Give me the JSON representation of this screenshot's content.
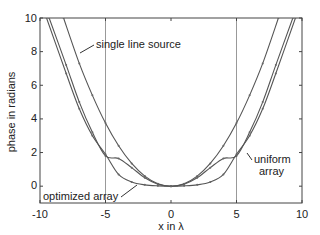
{
  "chart_data": {
    "type": "line",
    "title": "",
    "xlabel": "x in λ",
    "ylabel": "phase in radians",
    "xlim": [
      -10,
      10
    ],
    "ylim": [
      -1,
      10
    ],
    "xticks": [
      -10,
      -5,
      0,
      5,
      10
    ],
    "yticks": [
      0,
      2,
      4,
      6,
      8,
      10
    ],
    "xtick_labels": [
      "-10",
      "-5",
      "0",
      "5",
      "10"
    ],
    "ytick_labels": [
      "0",
      "2",
      "4",
      "6",
      "8",
      "10"
    ],
    "grid": false,
    "vertical_reference_lines": [
      -5,
      5
    ],
    "series": [
      {
        "name": "single line source",
        "x": [
          -8.2,
          -7,
          -6,
          -5,
          -4,
          -3,
          -2,
          -1,
          0,
          1,
          2,
          3,
          4,
          5,
          6,
          7,
          8.2
        ],
        "values": [
          10.0,
          7.3,
          5.4,
          3.75,
          2.4,
          1.35,
          0.6,
          0.15,
          0,
          0.15,
          0.6,
          1.35,
          2.4,
          3.75,
          5.4,
          7.3,
          10.0
        ]
      },
      {
        "name": "uniform array",
        "x": [
          -9.3,
          -8,
          -7,
          -6,
          -5,
          -4,
          -3,
          -2,
          -1,
          0,
          1,
          2,
          3,
          4,
          5,
          6,
          7,
          8,
          9.3
        ],
        "values": [
          10.0,
          7.2,
          5.0,
          3.2,
          1.8,
          1.65,
          1.1,
          0.5,
          0.12,
          0,
          0.12,
          0.5,
          1.1,
          1.65,
          1.8,
          3.2,
          5.0,
          7.2,
          10.0
        ]
      },
      {
        "name": "optimized array",
        "x": [
          -9.5,
          -8,
          -7,
          -6,
          -5,
          -4,
          -3,
          -2,
          -1,
          0,
          1,
          2,
          3,
          4,
          5,
          6,
          7,
          8,
          9.5
        ],
        "values": [
          10.0,
          6.7,
          4.6,
          3.0,
          1.9,
          0.7,
          0.25,
          0.08,
          0.02,
          0,
          0.02,
          0.08,
          0.25,
          0.7,
          1.9,
          3.0,
          4.6,
          6.7,
          10.0
        ]
      }
    ],
    "annotations": [
      {
        "text": "single line source",
        "target_series": "single line source"
      },
      {
        "text": "uniform",
        "target_series": "uniform array"
      },
      {
        "text": "array",
        "target_series": "uniform array"
      },
      {
        "text": "optimized array",
        "target_series": "optimized array"
      }
    ],
    "legend": "none (inline annotations)"
  },
  "labels": {
    "xlabel": "x in λ",
    "ylabel": "phase in radians",
    "single": "single line source",
    "uniform1": "uniform",
    "uniform2": "array",
    "optimized": "optimized array"
  },
  "ticks": {
    "x": [
      "-10",
      "-5",
      "0",
      "5",
      "10"
    ],
    "y": [
      "0",
      "2",
      "4",
      "6",
      "8",
      "10"
    ]
  },
  "colors": {
    "line": "#555555",
    "axis": "#333333",
    "refline": "#999999"
  }
}
